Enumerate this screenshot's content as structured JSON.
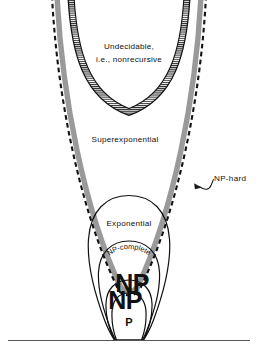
{
  "figure": {
    "background_color": "#ffffff",
    "ink_color": "#111111",
    "band_color": "#9a9a9a",
    "hatch_color": "#2a2a2a",
    "width": 258,
    "height": 359
  },
  "baseline": {
    "name": "ground-line",
    "y": 340,
    "x_start": 8,
    "x_end": 250,
    "color": "#555555"
  },
  "labels": {
    "undecidable_line1": "Undecidable,",
    "undecidable_line2": "i.e., nonrecursive",
    "superexponential": "Superexponential",
    "exponential": "Exponential",
    "np_complete": "NP-complete",
    "np_hard": "NP-hard",
    "np_big": "NP",
    "np_big_ghost": "NP",
    "p": "P"
  },
  "regions": [
    {
      "id": "undecidable",
      "label": "Undecidable, i.e., nonrecursive",
      "boundary_style": "hatched-band",
      "depth": 0
    },
    {
      "id": "superexponential",
      "label": "Superexponential",
      "boundary_style": "solid",
      "depth": 1
    },
    {
      "id": "np-hard",
      "label": "NP-hard",
      "boundary_style": "dashed-with-gray-band",
      "depth": 2
    },
    {
      "id": "exponential",
      "label": "Exponential",
      "boundary_style": "solid",
      "depth": 3
    },
    {
      "id": "np-complete",
      "label": "NP-complete",
      "boundary_style": "solid",
      "depth": 4
    },
    {
      "id": "np",
      "label": "NP",
      "boundary_style": "solid",
      "depth": 5
    },
    {
      "id": "p",
      "label": "P",
      "boundary_style": "solid",
      "depth": 6
    }
  ],
  "leader_line": {
    "name": "np-hard-leader",
    "arrow_tip_x": 198,
    "arrow_tip_y": 186,
    "text_anchor_x": 214,
    "text_anchor_y": 179
  }
}
